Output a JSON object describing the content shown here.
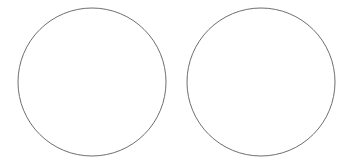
{
  "canvas": {
    "width": 350,
    "height": 164,
    "background": "#ffffff"
  },
  "shapes": [
    {
      "type": "circle",
      "cx": 92,
      "cy": 82,
      "r": 74,
      "fill": "#ffffff",
      "stroke": "#6e6e6e"
    },
    {
      "type": "circle",
      "cx": 261,
      "cy": 82,
      "r": 74,
      "fill": "#ffffff",
      "stroke": "#6e6e6e"
    }
  ]
}
